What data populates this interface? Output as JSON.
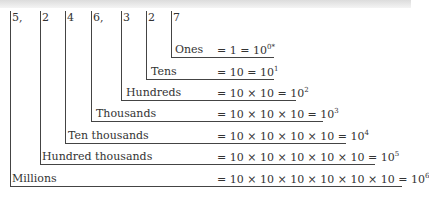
{
  "digits": [
    "5,",
    "2",
    "4",
    "6,",
    "3",
    "2",
    "7"
  ],
  "places": [
    {
      "label": "Ones",
      "equation": "=  1 = 10",
      "exponent": "0",
      "note": "*"
    },
    {
      "label": "Tens",
      "equation": "= 10 = 10",
      "exponent": "1",
      "note": ""
    },
    {
      "label": "Hundreds",
      "equation": "= 10 × 10 = 10",
      "exponent": "2",
      "note": ""
    },
    {
      "label": "Thousands",
      "equation": "= 10 × 10 × 10 = 10",
      "exponent": "3",
      "note": ""
    },
    {
      "label": "Ten thousands",
      "equation": "= 10 × 10 × 10 × 10 = 10",
      "exponent": "4",
      "note": ""
    },
    {
      "label": "Hundred thousands",
      "equation": "= 10 × 10 × 10 × 10 × 10 = 10",
      "exponent": "5",
      "note": ""
    },
    {
      "label": "Millions",
      "equation": "= 10 × 10 × 10 × 10 × 10 × 10 = 10",
      "exponent": "6",
      "note": ""
    }
  ]
}
